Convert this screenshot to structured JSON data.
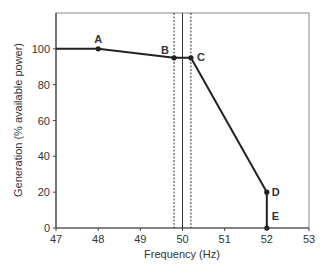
{
  "chart_data": {
    "type": "line",
    "title": "",
    "xlabel": "Frequency (Hz)",
    "ylabel": "Generation (% available power)",
    "xlim": [
      47,
      53
    ],
    "ylim": [
      0,
      120
    ],
    "x_ticks": [
      47,
      48,
      49,
      50,
      51,
      52,
      53
    ],
    "y_ticks": [
      0,
      20,
      40,
      60,
      80,
      100
    ],
    "grid": false,
    "legend": null,
    "series": [
      {
        "name": "Generation response",
        "x": [
          47,
          48,
          49.8,
          50.2,
          52,
          52
        ],
        "y": [
          100,
          100,
          95,
          95,
          20,
          0
        ],
        "color": "#222222"
      }
    ],
    "points": [
      {
        "label": "A",
        "x": 48,
        "y": 100
      },
      {
        "label": "B",
        "x": 49.8,
        "y": 95
      },
      {
        "label": "C",
        "x": 50.2,
        "y": 95
      },
      {
        "label": "D",
        "x": 52,
        "y": 20
      },
      {
        "label": "E",
        "x": 52,
        "y": 0
      }
    ],
    "vertical_lines": [
      {
        "x": 49.8,
        "style": "dashed"
      },
      {
        "x": 50.0,
        "style": "solid"
      },
      {
        "x": 50.2,
        "style": "dashed"
      }
    ]
  }
}
